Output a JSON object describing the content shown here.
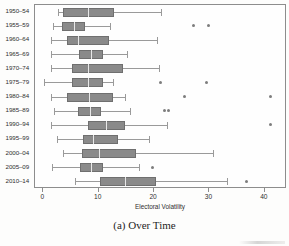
{
  "chart_data": {
    "type": "box",
    "title": "",
    "caption": "(a) Over Time",
    "xlabel": "Electoral Volatility",
    "ylabel": "",
    "xlim": [
      -1.5,
      44.0
    ],
    "xticks": [
      0,
      10,
      20,
      30,
      40
    ],
    "xtick_labels": [
      "0",
      "10",
      "20",
      "30",
      "40"
    ],
    "grid": false,
    "orientation": "horizontal",
    "legend": "none",
    "categories": [
      "1950–54",
      "1955–59",
      "1960–64",
      "1965–69",
      "1970–74",
      "1975–79",
      "1980–84",
      "1985–89",
      "1990–94",
      "1995–99",
      "2000–04",
      "2005–09",
      "2010–14"
    ],
    "boxes": [
      {
        "category": "1950–54",
        "whisker_low": 2.7,
        "q1": 3.6,
        "median": 8.1,
        "q3": 12.7,
        "whisker_high": 21.2,
        "outliers": []
      },
      {
        "category": "1955–59",
        "whisker_low": 1.8,
        "q1": 3.4,
        "median": 5.6,
        "q3": 7.6,
        "whisker_high": 12.1,
        "outliers": [
          27.1,
          29.9
        ]
      },
      {
        "category": "1960–64",
        "whisker_low": 1.4,
        "q1": 4.2,
        "median": 6.3,
        "q3": 11.8,
        "whisker_high": 20.6,
        "outliers": []
      },
      {
        "category": "1965–69",
        "whisker_low": 1.3,
        "q1": 6.5,
        "median": 8.7,
        "q3": 10.7,
        "whisker_high": 15.2,
        "outliers": []
      },
      {
        "category": "1970–74",
        "whisker_low": 1.4,
        "q1": 5.1,
        "median": 8.0,
        "q3": 14.3,
        "whisker_high": 20.8,
        "outliers": []
      },
      {
        "category": "1975–79",
        "whisker_low": 0.2,
        "q1": 5.2,
        "median": 8.1,
        "q3": 10.7,
        "whisker_high": 12.5,
        "outliers": [
          21.2,
          29.5
        ]
      },
      {
        "category": "1980–84",
        "whisker_low": 1.3,
        "q1": 4.3,
        "median": 8.3,
        "q3": 12.5,
        "whisker_high": 14.8,
        "outliers": [
          25.5,
          41.1
        ]
      },
      {
        "category": "1985–89",
        "whisker_low": 2.0,
        "q1": 6.3,
        "median": 8.5,
        "q3": 10.5,
        "whisker_high": 15.7,
        "outliers": [
          21.9,
          22.6
        ]
      },
      {
        "category": "1990–94",
        "whisker_low": 1.4,
        "q1": 8.1,
        "median": 11.4,
        "q3": 14.8,
        "whisker_high": 22.3,
        "outliers": [
          41.1
        ]
      },
      {
        "category": "1995–99",
        "whisker_low": 2.4,
        "q1": 7.1,
        "median": 9.0,
        "q3": 13.4,
        "whisker_high": 19.0,
        "outliers": []
      },
      {
        "category": "2000–04",
        "whisker_low": 3.6,
        "q1": 6.9,
        "median": 10.1,
        "q3": 16.8,
        "whisker_high": 30.6,
        "outliers": []
      },
      {
        "category": "2005–09",
        "whisker_low": 1.6,
        "q1": 6.7,
        "median": 8.7,
        "q3": 10.7,
        "whisker_high": 17.2,
        "outliers": [
          19.7
        ]
      },
      {
        "category": "2010–14",
        "whisker_low": 5.8,
        "q1": 10.3,
        "median": 14.8,
        "q3": 20.3,
        "whisker_high": 33.1,
        "outliers": [
          36.6
        ]
      }
    ],
    "colors": {
      "box_fill": "#8a8a8a",
      "box_edge": "#6f6f6f",
      "median": "#e8e8e8",
      "whisker": "#9a9a9a",
      "outlier": "#7d7d7d",
      "frame": "#8d8d8d",
      "text": "#2f2f2f"
    }
  }
}
